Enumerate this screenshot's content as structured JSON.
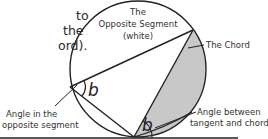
{
  "intro_text": {
    "lines": [
      "to",
      "the",
      "ord)."
    ]
  },
  "diagram": {
    "segment_label": [
      "The",
      "Opposite Segment",
      "(white)"
    ],
    "chord_label": "The Chord",
    "angle_symbol": "b",
    "opposite_angle_label": [
      "Angle in the",
      "opposite segment"
    ],
    "tangent_angle_label": [
      "Angle between",
      "tangent and chord"
    ],
    "colors": {
      "line": "#222222",
      "shaded_segment": "#c8c8c8",
      "background": "#ffffff"
    }
  }
}
